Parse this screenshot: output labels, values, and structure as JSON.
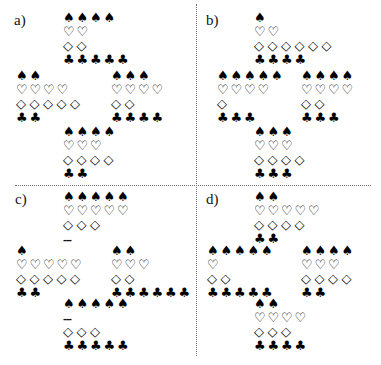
{
  "glyphs": {
    "S": "♠",
    "H": "♡",
    "D": "◇",
    "C": "♣"
  },
  "quadrants": [
    {
      "label": "a)",
      "hands": {
        "north": {
          "S": 4,
          "H": 2,
          "D": 2,
          "C": 5
        },
        "west": {
          "S": 2,
          "H": 4,
          "D": 5,
          "C": 2
        },
        "east": {
          "S": 3,
          "H": 4,
          "D": 2,
          "C": 4
        },
        "south": {
          "S": 4,
          "H": 3,
          "D": 4,
          "C": 2
        }
      }
    },
    {
      "label": "b)",
      "hands": {
        "north": {
          "S": 1,
          "H": 2,
          "D": 6,
          "C": 4
        },
        "west": {
          "S": 5,
          "H": 4,
          "D": 1,
          "C": 3
        },
        "east": {
          "S": 4,
          "H": 4,
          "D": 2,
          "C": 3
        },
        "south": {
          "S": 3,
          "H": 3,
          "D": 4,
          "C": 3
        }
      }
    },
    {
      "label": "c)",
      "hands": {
        "north": {
          "S": 5,
          "H": 5,
          "D": 3,
          "C": "---"
        },
        "west": {
          "S": 1,
          "H": 5,
          "D": 5,
          "C": 2
        },
        "east": {
          "S": 2,
          "H": 3,
          "D": 2,
          "C": 6
        },
        "south": {
          "S": 5,
          "H": "---",
          "D": 3,
          "C": 5
        }
      }
    },
    {
      "label": "d)",
      "hands": {
        "north": {
          "S": 2,
          "H": 5,
          "D": 4,
          "C": 2
        },
        "west": {
          "S": 5,
          "H": 1,
          "D": 2,
          "C": 5
        },
        "east": {
          "S": 4,
          "H": 3,
          "D": 4,
          "C": 2
        },
        "south": {
          "S": 2,
          "H": 4,
          "D": 3,
          "C": 4
        }
      }
    }
  ]
}
